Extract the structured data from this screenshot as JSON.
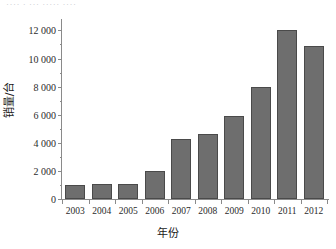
{
  "title_fragment": "····  ·  ···  ·····  ····",
  "chart_data": {
    "type": "bar",
    "title": "",
    "xlabel": "年份",
    "ylabel": "销量/台",
    "categories": [
      "2003",
      "2004",
      "2005",
      "2006",
      "2007",
      "2008",
      "2009",
      "2010",
      "2011",
      "2012"
    ],
    "values": [
      1000,
      1100,
      1100,
      2000,
      4300,
      4600,
      5900,
      8000,
      12000,
      10900
    ],
    "ylim": [
      0,
      12600
    ],
    "yticks": [
      0,
      2000,
      4000,
      6000,
      8000,
      10000,
      12000
    ],
    "ytick_labels": [
      "0",
      "2 000",
      "4 000",
      "6 000",
      "8 000",
      "10 000",
      "12 000"
    ],
    "yticks_minor": [
      1000,
      3000,
      5000,
      7000,
      9000,
      11000,
      12000
    ],
    "grid": false,
    "legend": false,
    "bar_color": "#6e6e6e",
    "bar_edge_color": "#4a4a4a",
    "axis_color": "#8a8a8a",
    "text_color": "#1b1b1b"
  }
}
